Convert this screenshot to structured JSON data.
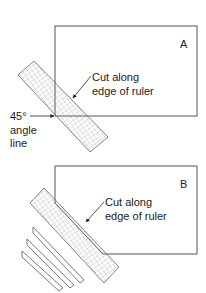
{
  "diagram": {
    "panel_a": {
      "letter": "A",
      "callout_line1": "Cut along",
      "callout_line2": "edge of ruler",
      "angle_label_line1": "45°",
      "angle_label_line2": "angle",
      "angle_label_line3": "line"
    },
    "panel_b": {
      "letter": "B",
      "callout_line1": "Cut along",
      "callout_line2": "edge of ruler"
    },
    "colors": {
      "line": "#555555",
      "text": "#222222",
      "grid": "#888888",
      "background": "#ffffff"
    }
  }
}
